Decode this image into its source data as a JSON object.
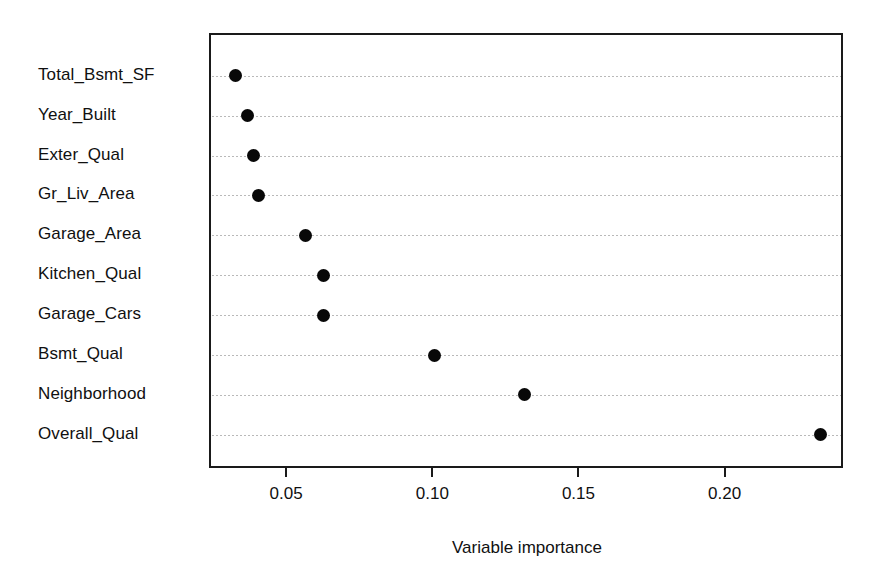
{
  "chart_data": {
    "type": "scatter",
    "subtype": "cleveland-dot-plot",
    "title": "",
    "xlabel": "Variable importance",
    "ylabel": "",
    "categories": [
      "Total_Bsmt_SF",
      "Year_Built",
      "Exter_Qual",
      "Gr_Liv_Area",
      "Garage_Area",
      "Kitchen_Qual",
      "Garage_Cars",
      "Bsmt_Qual",
      "Neighborhood",
      "Overall_Qual"
    ],
    "values": [
      0.032,
      0.036,
      0.038,
      0.04,
      0.056,
      0.062,
      0.062,
      0.1,
      0.131,
      0.232
    ],
    "points": [
      {
        "label": "Total_Bsmt_SF",
        "value": 0.032
      },
      {
        "label": "Year_Built",
        "value": 0.036
      },
      {
        "label": "Exter_Qual",
        "value": 0.038
      },
      {
        "label": "Gr_Liv_Area",
        "value": 0.04
      },
      {
        "label": "Garage_Area",
        "value": 0.056
      },
      {
        "label": "Kitchen_Qual",
        "value": 0.062
      },
      {
        "label": "Garage_Cars",
        "value": 0.062
      },
      {
        "label": "Bsmt_Qual",
        "value": 0.1
      },
      {
        "label": "Neighborhood",
        "value": 0.131
      },
      {
        "label": "Overall_Qual",
        "value": 0.232
      }
    ],
    "xticks": [
      0.05,
      0.1,
      0.15,
      0.2
    ],
    "xtick_labels": [
      "0.05",
      "0.10",
      "0.15",
      "0.20"
    ],
    "xlim": [
      0.0236,
      0.2405
    ],
    "grid": "horizontal-dotted",
    "legend": "none",
    "marker": "filled-circle",
    "marker_color": "#080808",
    "grid_color": "#b9b9b9",
    "axis_color": "#1a1a1a",
    "background": "#ffffff"
  },
  "figure": {
    "cropped_title": ""
  }
}
